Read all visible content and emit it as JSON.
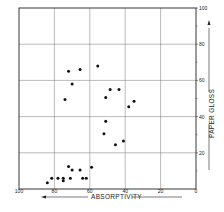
{
  "chart_data": {
    "type": "scatter",
    "title": "",
    "xlabel": "ABSORPTIVITY",
    "ylabel": "PAPER GLOSS",
    "xlim": [
      100,
      0
    ],
    "ylim": [
      0,
      100
    ],
    "x_reversed": true,
    "grid": true,
    "x_ticks": [
      "100",
      "80",
      "60",
      "40",
      "20",
      "0"
    ],
    "y_ticks": [
      "20",
      "40",
      "60",
      "80",
      "100"
    ],
    "series": [
      {
        "name": "samples",
        "points": [
          [
            72,
            65
          ],
          [
            65.5,
            66
          ],
          [
            55.5,
            68
          ],
          [
            70,
            58
          ],
          [
            74,
            49.5
          ],
          [
            48.5,
            55
          ],
          [
            43.5,
            55
          ],
          [
            51,
            50.5
          ],
          [
            35,
            48.5
          ],
          [
            38,
            45.5
          ],
          [
            51,
            37.5
          ],
          [
            52,
            30.5
          ],
          [
            41,
            26.5
          ],
          [
            45.5,
            24.5
          ],
          [
            72,
            12.5
          ],
          [
            59,
            12
          ],
          [
            70,
            10.5
          ],
          [
            65.5,
            10.5
          ],
          [
            81.5,
            6
          ],
          [
            78,
            6
          ],
          [
            75,
            6
          ],
          [
            75,
            4.5
          ],
          [
            71,
            6
          ],
          [
            64,
            6
          ],
          [
            62,
            6
          ],
          [
            84,
            3.5
          ]
        ]
      }
    ]
  }
}
